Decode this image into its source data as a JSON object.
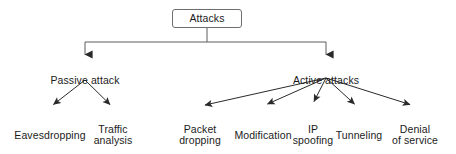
{
  "diagram": {
    "title": "Attacks",
    "type": "tree-diagram",
    "colors": {
      "line": "#2a2a2a",
      "box_border": "#6e6e6e",
      "text": "#1b1b1b",
      "background": "#ffffff"
    },
    "root": {
      "label": "Attacks",
      "box": {
        "x": 172,
        "y": 9,
        "width": 70,
        "height": 19
      }
    },
    "level1": [
      {
        "label": "Passive attack",
        "x": 85,
        "y": 63,
        "width": 92
      },
      {
        "label": "Active attacks",
        "x": 326,
        "y": 63,
        "width": 92
      }
    ],
    "level2": {
      "passive": [
        {
          "label": "Eavesdropping",
          "x": 50,
          "y": 118,
          "width": 96
        },
        {
          "label": "Traffic\nanalysis",
          "x": 113,
          "y": 112,
          "width": 62
        }
      ],
      "active": [
        {
          "label": "Packet\ndropping",
          "x": 200,
          "y": 112,
          "width": 62
        },
        {
          "label": "Modification",
          "x": 263,
          "y": 118,
          "width": 84
        },
        {
          "label": "IP\nspoofing",
          "x": 313,
          "y": 112,
          "width": 58
        },
        {
          "label": "Tunneling",
          "x": 359,
          "y": 118,
          "width": 70
        },
        {
          "label": "Denial\nof service",
          "x": 415,
          "y": 112,
          "width": 70
        }
      ]
    },
    "edges": {
      "root_stem": {
        "x": 207,
        "y1": 28,
        "y2": 42
      },
      "bus": {
        "y": 42,
        "x1": 85,
        "x2": 326
      },
      "drops": [
        {
          "x": 85,
          "y1": 42,
          "y2": 58
        },
        {
          "x": 326,
          "y1": 42,
          "y2": 58
        }
      ],
      "passive_fan_origin": {
        "x": 85,
        "y": 80
      },
      "active_fan_origin": {
        "x": 326,
        "y": 78
      },
      "passive_targets": [
        {
          "x": 50,
          "y": 108
        },
        {
          "x": 113,
          "y": 108
        }
      ],
      "active_targets": [
        {
          "x": 200,
          "y": 108
        },
        {
          "x": 263,
          "y": 108
        },
        {
          "x": 313,
          "y": 106
        },
        {
          "x": 358,
          "y": 108
        },
        {
          "x": 415,
          "y": 108
        }
      ]
    }
  }
}
